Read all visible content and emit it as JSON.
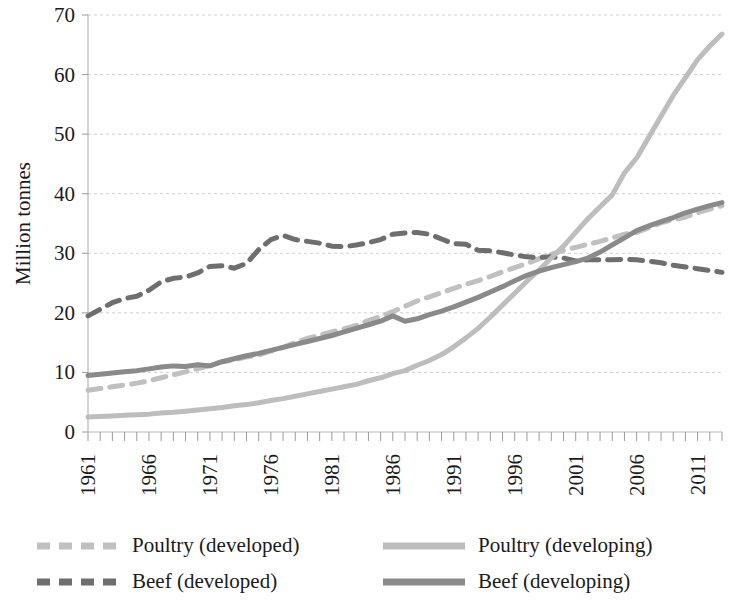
{
  "chart_data": {
    "type": "line",
    "title": "",
    "xlabel": "",
    "ylabel": "Million tonnes",
    "ylim": [
      0,
      70
    ],
    "xlim": [
      1961,
      2013
    ],
    "ytick_labels": [
      "0",
      "10",
      "20",
      "30",
      "40",
      "50",
      "60",
      "70"
    ],
    "yticks": [
      0,
      10,
      20,
      30,
      40,
      50,
      60,
      70
    ],
    "xtick_labels": [
      "1961",
      "1966",
      "1971",
      "1976",
      "1981",
      "1986",
      "1991",
      "1996",
      "2001",
      "2006",
      "2011"
    ],
    "xticks": [
      1961,
      1966,
      1971,
      1976,
      1981,
      1986,
      1991,
      1996,
      2001,
      2006,
      2011
    ],
    "grid": true,
    "legend_position": "bottom",
    "x": [
      1961,
      1962,
      1963,
      1964,
      1965,
      1966,
      1967,
      1968,
      1969,
      1970,
      1971,
      1972,
      1973,
      1974,
      1975,
      1976,
      1977,
      1978,
      1979,
      1980,
      1981,
      1982,
      1983,
      1984,
      1985,
      1986,
      1987,
      1988,
      1989,
      1990,
      1991,
      1992,
      1993,
      1994,
      1995,
      1996,
      1997,
      1998,
      1999,
      2000,
      2001,
      2002,
      2003,
      2004,
      2005,
      2006,
      2007,
      2008,
      2009,
      2010,
      2011,
      2012,
      2013
    ],
    "series": [
      {
        "name": "Poultry (developed)",
        "color": "#c0c0c0",
        "style": "dashed",
        "width": 5,
        "values": [
          7.0,
          7.3,
          7.6,
          7.9,
          8.2,
          8.6,
          9.1,
          9.6,
          10.1,
          10.6,
          11.2,
          11.8,
          12.1,
          12.6,
          12.9,
          13.6,
          14.2,
          15.0,
          15.7,
          16.3,
          16.8,
          17.3,
          17.9,
          18.7,
          19.4,
          20.2,
          21.1,
          22.0,
          22.7,
          23.4,
          24.1,
          24.8,
          25.4,
          26.1,
          26.9,
          27.6,
          28.3,
          29.1,
          29.8,
          30.5,
          31.0,
          31.5,
          32.0,
          32.6,
          33.2,
          33.5,
          34.3,
          35.1,
          35.6,
          36.1,
          36.8,
          37.4,
          38.0
        ]
      },
      {
        "name": "Beef (developed)",
        "color": "#6e6e6e",
        "style": "dashed",
        "width": 5,
        "values": [
          19.5,
          20.6,
          21.7,
          22.4,
          22.8,
          23.8,
          25.2,
          25.8,
          26.0,
          26.7,
          27.8,
          27.9,
          27.5,
          28.3,
          30.6,
          32.3,
          33.0,
          32.3,
          32.0,
          31.7,
          31.2,
          31.1,
          31.4,
          31.8,
          32.3,
          33.2,
          33.4,
          33.5,
          33.2,
          32.4,
          31.6,
          31.5,
          30.5,
          30.4,
          30.1,
          29.7,
          29.4,
          29.3,
          29.4,
          29.2,
          28.7,
          28.9,
          28.9,
          28.9,
          29.0,
          28.9,
          28.7,
          28.4,
          28.0,
          27.7,
          27.4,
          27.1,
          26.8
        ]
      },
      {
        "name": "Poultry (developing)",
        "color": "#bdbdbd",
        "style": "solid",
        "width": 5,
        "values": [
          2.5,
          2.6,
          2.7,
          2.8,
          2.9,
          3.0,
          3.2,
          3.3,
          3.5,
          3.7,
          3.9,
          4.1,
          4.4,
          4.6,
          4.9,
          5.3,
          5.6,
          6.0,
          6.4,
          6.8,
          7.2,
          7.6,
          8.0,
          8.6,
          9.1,
          9.8,
          10.3,
          11.2,
          12.0,
          13.0,
          14.3,
          15.8,
          17.4,
          19.3,
          21.3,
          23.3,
          25.3,
          27.2,
          29.2,
          31.2,
          33.5,
          35.8,
          37.8,
          39.8,
          43.5,
          46.0,
          49.5,
          53.0,
          56.5,
          59.5,
          62.5,
          64.8,
          66.8
        ]
      },
      {
        "name": "Beef (developing)",
        "color": "#8a8a8a",
        "style": "solid",
        "width": 5,
        "values": [
          9.5,
          9.7,
          9.9,
          10.1,
          10.3,
          10.6,
          10.9,
          11.1,
          11.0,
          11.3,
          11.1,
          11.8,
          12.3,
          12.8,
          13.2,
          13.7,
          14.2,
          14.7,
          15.2,
          15.7,
          16.2,
          16.8,
          17.4,
          18.0,
          18.6,
          19.5,
          18.6,
          19.0,
          19.7,
          20.3,
          21.0,
          21.8,
          22.6,
          23.5,
          24.4,
          25.4,
          26.3,
          27.0,
          27.6,
          28.1,
          28.6,
          29.2,
          30.2,
          31.4,
          32.6,
          33.8,
          34.6,
          35.3,
          36.0,
          36.8,
          37.4,
          38.0,
          38.5
        ]
      }
    ],
    "legend": [
      {
        "label": "Poultry (developed)",
        "color": "#c0c0c0",
        "style": "dashed"
      },
      {
        "label": "Poultry (developing)",
        "color": "#bdbdbd",
        "style": "solid"
      },
      {
        "label": "Beef (developed)",
        "color": "#6e6e6e",
        "style": "dashed"
      },
      {
        "label": "Beef (developing)",
        "color": "#8a8a8a",
        "style": "solid"
      }
    ]
  }
}
